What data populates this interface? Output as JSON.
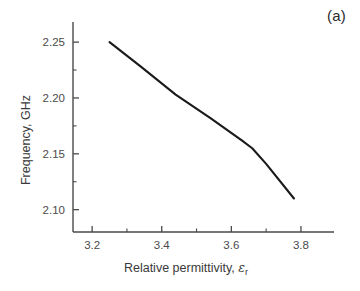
{
  "figure": {
    "panel_label": "(a)",
    "background_color": "#ffffff",
    "curve_color": "#1a1a1a",
    "axis_color": "#4a4a4a"
  },
  "chart_data": {
    "type": "line",
    "title": "",
    "subtitle": "",
    "xlabel": "Relative permittivity, εr",
    "xlabel_main": "Relative permittivity, ",
    "xlabel_symbol": "ε",
    "xlabel_subscript": "r",
    "ylabel": "Frequency, GHz",
    "xlim": [
      3.145,
      3.895
    ],
    "ylim": [
      2.08,
      2.268
    ],
    "xticks": [
      3.2,
      3.4,
      3.6,
      3.8
    ],
    "xtick_labels": [
      "3.2",
      "3.4",
      "3.6",
      "3.8"
    ],
    "xminor_ticks": [
      3.3,
      3.5,
      3.7
    ],
    "yticks": [
      2.1,
      2.15,
      2.2,
      2.25
    ],
    "ytick_labels": [
      "2.10",
      "2.15",
      "2.20",
      "2.25"
    ],
    "yminor_ticks": [
      2.125,
      2.175,
      2.225
    ],
    "grid": false,
    "legend": null,
    "annotations": [
      {
        "text": "(a)",
        "position": "top-right"
      }
    ],
    "series": [
      {
        "name": "Resonant frequency vs relative permittivity",
        "x": [
          3.25,
          3.34,
          3.44,
          3.54,
          3.63,
          3.66,
          3.7,
          3.78
        ],
        "y": [
          2.25,
          2.228,
          2.203,
          2.182,
          2.162,
          2.155,
          2.141,
          2.11
        ]
      }
    ]
  }
}
